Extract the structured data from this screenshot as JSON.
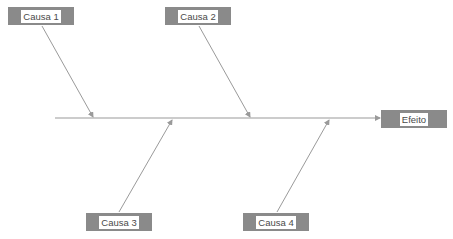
{
  "diagram": {
    "type": "fishbone",
    "colors": {
      "box_fill": "#8a8a8a",
      "label_bg": "#ffffff",
      "label_text": "#4a4a4a",
      "line": "#9a9a9a"
    },
    "effect": {
      "label": "Efeito"
    },
    "causes": [
      {
        "label": "Causa 1",
        "position": "top"
      },
      {
        "label": "Causa 2",
        "position": "top"
      },
      {
        "label": "Causa 3",
        "position": "bottom"
      },
      {
        "label": "Causa 4",
        "position": "bottom"
      }
    ]
  }
}
